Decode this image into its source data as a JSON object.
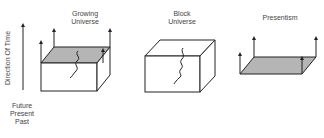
{
  "axis": {
    "label": "Direction Of Time",
    "levels": [
      "Future",
      "Present",
      "Past"
    ]
  },
  "panels": [
    {
      "title_line1": "Growing",
      "title_line2": "Universe"
    },
    {
      "title_line1": "Block",
      "title_line2": "Universe"
    },
    {
      "title_line1": "Presentism",
      "title_line2": ""
    }
  ],
  "colors": {
    "line": "#222222",
    "shade": "#b5b5b5"
  }
}
